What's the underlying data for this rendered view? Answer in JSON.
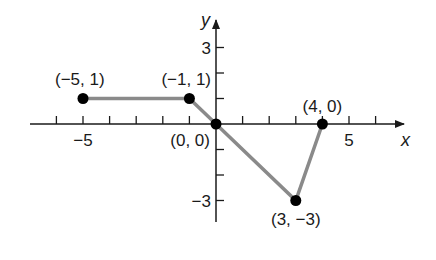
{
  "chart_data": {
    "type": "line",
    "title": "",
    "xlabel": "x",
    "ylabel": "y",
    "xlim": [
      -7,
      7
    ],
    "ylim": [
      -4,
      4
    ],
    "grid": false,
    "x_tick_labels": [
      {
        "value": -5,
        "label": "−5"
      },
      {
        "value": 5,
        "label": "5"
      }
    ],
    "y_tick_labels": [
      {
        "value": 3,
        "label": "3"
      },
      {
        "value": -3,
        "label": "−3"
      }
    ],
    "series": [
      {
        "name": "piecewise",
        "x": [
          -5,
          -1,
          0,
          3,
          4
        ],
        "y": [
          1,
          1,
          0,
          -3,
          0
        ]
      }
    ],
    "points": [
      {
        "x": -5,
        "y": 1,
        "label": "(−5, 1)"
      },
      {
        "x": -1,
        "y": 1,
        "label": "(−1, 1)"
      },
      {
        "x": 0,
        "y": 0,
        "label": "(0, 0)"
      },
      {
        "x": 3,
        "y": -3,
        "label": "(3, −3)"
      },
      {
        "x": 4,
        "y": 0,
        "label": "(4, 0)"
      }
    ],
    "colors": {
      "line": "#8a8a8a",
      "point": "#000000",
      "axis": "#1a1a1a"
    }
  }
}
